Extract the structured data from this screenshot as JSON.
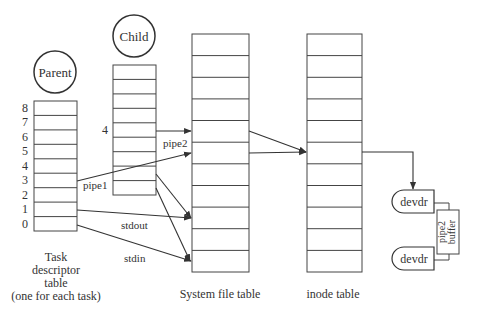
{
  "nodes": {
    "parent": {
      "label": "Parent"
    },
    "child": {
      "label": "Child"
    }
  },
  "parent_table": {
    "row_labels": [
      "8",
      "7",
      "6",
      "5",
      "4",
      "3",
      "2",
      "1",
      "0"
    ],
    "caption": [
      "Task",
      "descriptor",
      "table",
      "(one for each task)"
    ]
  },
  "child_table": {
    "row_label": "4"
  },
  "system_file_table": {
    "caption": "System file table",
    "rows": 11
  },
  "inode_table": {
    "caption": "inode table",
    "rows": 11
  },
  "edge_labels": {
    "pipe1": "pipe1",
    "pipe2": "pipe2",
    "stdout": "stdout",
    "stdin": "stdin"
  },
  "devices": {
    "top": "devdr",
    "bottom": "devdr",
    "buffer_line1": "pipe2",
    "buffer_line2": "buffer"
  },
  "colors": {
    "line": "#444444",
    "text": "#333333",
    "background": "#ffffff"
  }
}
